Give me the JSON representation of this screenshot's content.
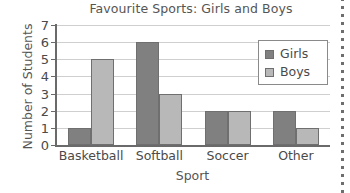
{
  "chart_data": {
    "type": "bar",
    "title": "Favourite Sports: Girls and Boys",
    "xlabel": "Sport",
    "ylabel": "Number of Students",
    "categories": [
      "Basketball",
      "Softball",
      "Soccer",
      "Other"
    ],
    "series": [
      {
        "name": "Girls",
        "color": "#808080",
        "values": [
          1,
          6,
          2,
          2
        ]
      },
      {
        "name": "Boys",
        "color": "#b8b8b8",
        "values": [
          5,
          3,
          2,
          1
        ]
      }
    ],
    "ylim": [
      0,
      7
    ],
    "ytick_labels": [
      "7",
      "6",
      "5",
      "4",
      "3",
      "2",
      "1",
      "0"
    ],
    "ytick_values": [
      7,
      6,
      5,
      4,
      3,
      2,
      1,
      0
    ],
    "grid": true,
    "legend_position": "top-right",
    "legend_entries": [
      "Girls",
      "Boys"
    ]
  },
  "decor": {
    "margin_rule": "dotted-vertical-margin-line"
  }
}
